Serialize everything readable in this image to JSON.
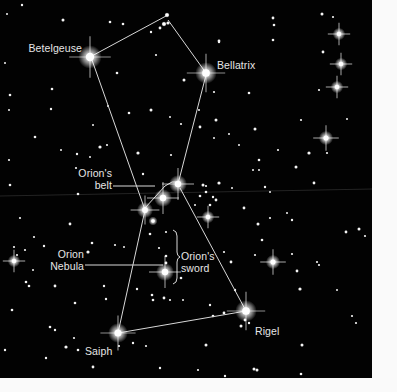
{
  "figure": {
    "colors": {
      "sky": "#020202",
      "star": "#ffffff",
      "line": "#d8d8d8",
      "label": "#e6e6e6",
      "page": "#fafafa"
    }
  },
  "labels": {
    "betelgeuse": "Betelgeuse",
    "bellatrix": "Bellatrix",
    "belt_line1": "Orion's",
    "belt_line2": "belt",
    "nebula_line1": "Orion",
    "nebula_line2": "Nebula",
    "sword_line1": "Orion's",
    "sword_line2": "sword",
    "saiph": "Saiph",
    "rigel": "Rigel"
  },
  "named_stars": [
    {
      "name": "Betelgeuse",
      "brightness": "very-bright"
    },
    {
      "name": "Bellatrix",
      "brightness": "bright"
    },
    {
      "name": "Alnitak",
      "brightness": "bright"
    },
    {
      "name": "Alnilam",
      "brightness": "bright"
    },
    {
      "name": "Mintaka",
      "brightness": "bright"
    },
    {
      "name": "Saiph",
      "brightness": "bright"
    },
    {
      "name": "Rigel",
      "brightness": "very-bright"
    },
    {
      "name": "Orion Nebula",
      "brightness": "bright"
    }
  ]
}
